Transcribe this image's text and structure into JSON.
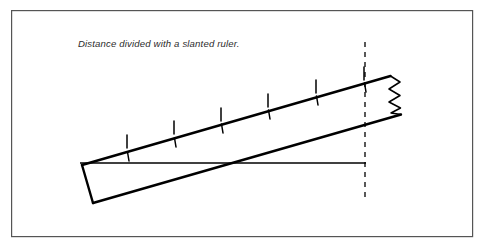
{
  "figure": {
    "caption": "Distance divided with a slanted ruler.",
    "caption_position": {
      "x": 78,
      "y": 47
    },
    "frame": {
      "name": "figure-border",
      "x": 11,
      "y": 10,
      "width": 462,
      "height": 227,
      "stroke": "#555555",
      "stroke_width": 1.2,
      "fill": "#ffffff"
    },
    "colors": {
      "ink": "#000000",
      "border": "#555555",
      "background": "#ffffff",
      "caption": "#2b2b2b"
    },
    "ruler": {
      "name": "slanted-ruler",
      "description": "Parallelogram drawn as a ruler, slanted upward to the right, broken off at the right end",
      "top_edge": {
        "x1": 82,
        "y1": 165,
        "x2": 390,
        "y2": 76
      },
      "bottom_edge": {
        "x1": 93,
        "y1": 203,
        "x2": 401,
        "y2": 114
      },
      "left_end": {
        "x1": 82,
        "y1": 165,
        "x2": 93,
        "y2": 203
      },
      "stroke_width": 2.2
    },
    "break_symbol": {
      "name": "zigzag-break",
      "points": "390,76 399,82 389,89 399,95 389,101 400,107 391,113 401,114",
      "stroke_width": 1.4
    },
    "tick_marks": {
      "name": "ruler-ticks",
      "count": 6,
      "length_above": 14,
      "length_below": 8,
      "positions_x": [
        127,
        174,
        221,
        268,
        316,
        364
      ],
      "stroke_width": 1.4
    },
    "baseline": {
      "name": "horizontal-baseline",
      "x1": 80,
      "y1": 163,
      "x2": 366,
      "y2": 163,
      "stroke_width": 1.6
    },
    "dashed_line": {
      "name": "vertical-dashed-reference",
      "x": 365,
      "y1": 42,
      "y2": 200,
      "stroke_width": 1.3,
      "dash": "5 5"
    }
  }
}
